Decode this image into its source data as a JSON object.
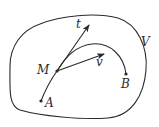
{
  "diagram": {
    "region_label": "V",
    "point_labels": {
      "start": "A",
      "end": "B",
      "current": "M"
    },
    "vector_labels": {
      "tangent": "t",
      "velocity": "v"
    },
    "colors": {
      "stroke": "#2a2a2a",
      "background": "#ffffff"
    }
  }
}
